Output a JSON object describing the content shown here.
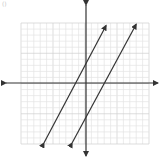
{
  "corner_label": "()",
  "chart_data": {
    "type": "line",
    "title": "",
    "xlabel": "",
    "ylabel": "",
    "xlim": [
      -10,
      10
    ],
    "ylim": [
      -10,
      10
    ],
    "grid": true,
    "grid_major_every": 5,
    "axes_arrows": true,
    "series": [
      {
        "name": "line-1",
        "equation": "y = 2x + 3",
        "slope": 2,
        "intercept": 3,
        "x": [
          -6.4,
          3.3
        ],
        "y": [
          -9.8,
          9.6
        ],
        "arrows": "both"
      },
      {
        "name": "line-2",
        "equation": "y = 2x - 6",
        "slope": 2,
        "intercept": -6,
        "x": [
          -2,
          8
        ],
        "y": [
          -9.8,
          9.8
        ],
        "arrows": "both"
      }
    ]
  },
  "layout": {
    "grid_px": {
      "left": 21,
      "top": 23,
      "right": 149,
      "bottom": 144
    },
    "origin_px": {
      "x": 86,
      "y": 83
    },
    "x_axis_px": {
      "x1": 6,
      "x2": 158
    },
    "y_axis_px": {
      "y1": 5,
      "y2": 156
    },
    "colors": {
      "grid_minor": "#e4e4e4",
      "grid_major": "#cfcfcf",
      "axis": "#333333",
      "line": "#333333"
    }
  }
}
